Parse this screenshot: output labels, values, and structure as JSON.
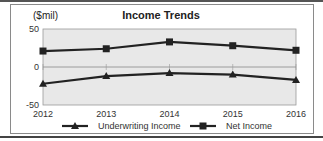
{
  "chart_data": {
    "type": "line",
    "title": "Income Trends",
    "ylabel": "($mil)",
    "xlabel": "",
    "categories": [
      "2012",
      "2013",
      "2014",
      "2015",
      "2016"
    ],
    "series": [
      {
        "name": "Underwriting Income",
        "marker": "triangle",
        "values": [
          -22,
          -12,
          -8,
          -10,
          -17
        ]
      },
      {
        "name": "Net Income",
        "marker": "square",
        "values": [
          21,
          24,
          33,
          28,
          22
        ]
      }
    ],
    "ylim": [
      -50,
      50
    ],
    "yticks": [
      50,
      0,
      -50
    ],
    "grid": false,
    "plot_background": "#e8e8e8",
    "line_color": "#222222",
    "legend_position": "bottom"
  }
}
